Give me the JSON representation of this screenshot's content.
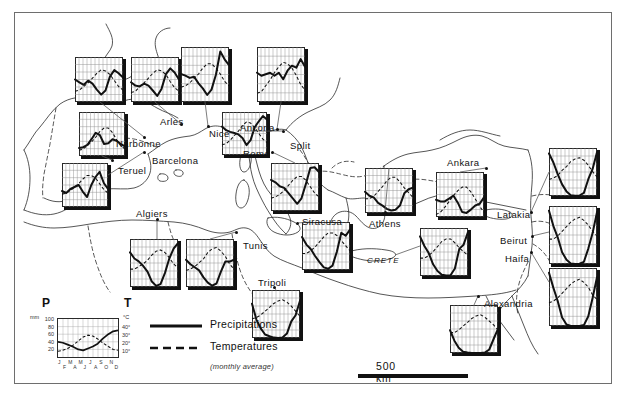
{
  "figure": {
    "frame_color": "#6e6e6e"
  },
  "legend": {
    "p_label": "P",
    "t_label": "T",
    "p_unit": "mm",
    "t_unit": "°C",
    "p_ticks": [
      "100",
      "80",
      "60",
      "40",
      "20"
    ],
    "t_ticks": [
      "40°",
      "30°",
      "20°",
      "10°"
    ],
    "months_top": [
      "J",
      "M",
      "M",
      "J",
      "S",
      "N"
    ],
    "months_bottom": [
      "F",
      "A",
      "J",
      "A",
      "O",
      "D"
    ],
    "key_precip": "Precipitations",
    "key_temp": "Temperatures",
    "note": "(monthly average)"
  },
  "scale": {
    "label": "500 km",
    "bar_km": 500
  },
  "cities": [
    {
      "name": "Arles",
      "label_x": 160,
      "label_y": 116,
      "dot_x": 181,
      "dot_y": 124
    },
    {
      "name": "Narbonne",
      "label_x": 116,
      "label_y": 138,
      "dot_x": 144,
      "dot_y": 137
    },
    {
      "name": "Nice",
      "label_x": 209,
      "label_y": 128,
      "dot_x": 208,
      "dot_y": 126
    },
    {
      "name": "Ancona",
      "label_x": 240,
      "label_y": 122,
      "dot_x": 277,
      "dot_y": 129
    },
    {
      "name": "Split",
      "label_x": 290,
      "label_y": 140,
      "dot_x": 283,
      "dot_y": 131
    },
    {
      "name": "Barcelona",
      "label_x": 152,
      "label_y": 155,
      "dot_x": 144,
      "dot_y": 152
    },
    {
      "name": "Teruel",
      "label_x": 118,
      "label_y": 165,
      "dot_x": 112,
      "dot_y": 160
    },
    {
      "name": "Rome",
      "label_x": 243,
      "label_y": 148,
      "dot_x": 272,
      "dot_y": 152
    },
    {
      "name": "Ankara",
      "label_x": 447,
      "label_y": 157,
      "dot_x": 486,
      "dot_y": 168
    },
    {
      "name": "Algiers",
      "label_x": 136,
      "label_y": 208,
      "dot_x": 157,
      "dot_y": 219
    },
    {
      "name": "Tunis",
      "label_x": 243,
      "label_y": 240,
      "dot_x": 236,
      "dot_y": 232
    },
    {
      "name": "Siracusa",
      "label_x": 302,
      "label_y": 216,
      "dot_x": 297,
      "dot_y": 223
    },
    {
      "name": "Athens",
      "label_x": 369,
      "label_y": 218,
      "dot_x": 385,
      "dot_y": 212
    },
    {
      "name": "Latakia",
      "label_x": 497,
      "label_y": 209,
      "dot_x": 531,
      "dot_y": 212
    },
    {
      "name": "Beirut",
      "label_x": 500,
      "label_y": 235,
      "dot_x": 532,
      "dot_y": 236
    },
    {
      "name": "Haifa",
      "label_x": 505,
      "label_y": 253,
      "dot_x": 531,
      "dot_y": 252
    },
    {
      "name": "Tripoli",
      "label_x": 258,
      "label_y": 277,
      "dot_x": 274,
      "dot_y": 287
    },
    {
      "name": "Alexandria",
      "label_x": 484,
      "label_y": 298,
      "dot_x": 478,
      "dot_y": 296
    }
  ],
  "regions": [
    {
      "name": "CRETE",
      "x": 367,
      "y": 256
    }
  ],
  "chart_data": {
    "type": "line",
    "xlabel": "",
    "ylabel": "",
    "grid": true,
    "legend_position": "bottom-left",
    "x": [
      "J",
      "F",
      "M",
      "A",
      "M",
      "J",
      "J",
      "A",
      "S",
      "O",
      "N",
      "D"
    ],
    "p_axis": {
      "unit": "mm",
      "ticks": [
        20,
        40,
        60,
        80,
        100
      ],
      "ylim": [
        0,
        100
      ]
    },
    "t_axis": {
      "unit": "°C",
      "ticks": [
        10,
        20,
        30,
        40
      ],
      "ylim": [
        0,
        40
      ]
    },
    "series_names": [
      "Precipitations",
      "Temperatures"
    ],
    "stations": [
      {
        "name": "Narbonne",
        "x": 75,
        "y": 57,
        "w": 48,
        "h": 45,
        "precipitation": [
          55,
          48,
          42,
          52,
          45,
          30,
          18,
          28,
          62,
          78,
          70,
          60
        ],
        "temperature": [
          7,
          8,
          11,
          14,
          18,
          22,
          25,
          24,
          21,
          16,
          11,
          8
        ]
      },
      {
        "name": "Arles",
        "x": 131,
        "y": 57,
        "w": 48,
        "h": 45,
        "precipitation": [
          48,
          40,
          38,
          45,
          40,
          28,
          15,
          32,
          68,
          82,
          72,
          55
        ],
        "temperature": [
          6,
          7,
          11,
          14,
          18,
          22,
          25,
          24,
          21,
          15,
          10,
          7
        ]
      },
      {
        "name": "Nice",
        "x": 181,
        "y": 47,
        "w": 48,
        "h": 55,
        "precipitation": [
          72,
          68,
          62,
          65,
          48,
          35,
          18,
          32,
          70,
          130,
          110,
          95
        ],
        "temperature": [
          8,
          9,
          11,
          14,
          17,
          21,
          24,
          24,
          21,
          17,
          12,
          9
        ]
      },
      {
        "name": "Ancona",
        "x": 257,
        "y": 47,
        "w": 48,
        "h": 55,
        "precipitation": [
          58,
          52,
          55,
          58,
          52,
          58,
          45,
          62,
          72,
          68,
          85,
          70
        ],
        "temperature": [
          4,
          5,
          9,
          13,
          18,
          22,
          25,
          24,
          21,
          16,
          10,
          6
        ]
      },
      {
        "name": "Teruel",
        "x": 79,
        "y": 112,
        "w": 46,
        "h": 44,
        "precipitation": [
          20,
          22,
          28,
          42,
          58,
          52,
          30,
          32,
          42,
          38,
          30,
          24
        ],
        "temperature": [
          3,
          4,
          7,
          10,
          14,
          19,
          22,
          22,
          18,
          12,
          7,
          4
        ]
      },
      {
        "name": "Barcelona",
        "x": 62,
        "y": 163,
        "w": 46,
        "h": 44,
        "precipitation": [
          40,
          35,
          45,
          50,
          55,
          38,
          25,
          55,
          75,
          88,
          60,
          45
        ],
        "temperature": [
          9,
          10,
          12,
          15,
          18,
          22,
          25,
          25,
          23,
          18,
          13,
          10
        ]
      },
      {
        "name": "Split",
        "x": 222,
        "y": 112,
        "w": 45,
        "h": 43,
        "precipitation": [
          80,
          70,
          65,
          62,
          58,
          48,
          28,
          42,
          78,
          95,
          110,
          100
        ],
        "temperature": [
          7,
          8,
          11,
          15,
          19,
          24,
          27,
          26,
          22,
          17,
          12,
          9
        ]
      },
      {
        "name": "Rome",
        "x": 271,
        "y": 163,
        "w": 48,
        "h": 48,
        "precipitation": [
          78,
          72,
          62,
          58,
          45,
          32,
          18,
          32,
          68,
          108,
          110,
          98
        ],
        "temperature": [
          8,
          9,
          11,
          14,
          18,
          22,
          25,
          25,
          22,
          17,
          12,
          9
        ]
      },
      {
        "name": "Athens",
        "x": 365,
        "y": 168,
        "w": 48,
        "h": 45,
        "precipitation": [
          52,
          42,
          38,
          25,
          18,
          10,
          6,
          8,
          18,
          48,
          58,
          62
        ],
        "temperature": [
          10,
          10,
          12,
          16,
          20,
          25,
          28,
          28,
          24,
          19,
          15,
          11
        ]
      },
      {
        "name": "Ankara",
        "x": 436,
        "y": 172,
        "w": 48,
        "h": 45,
        "precipitation": [
          42,
          38,
          38,
          45,
          52,
          35,
          12,
          10,
          18,
          28,
          32,
          48
        ],
        "temperature": [
          0,
          2,
          6,
          11,
          16,
          20,
          23,
          23,
          19,
          13,
          7,
          2
        ]
      },
      {
        "name": "Algiers",
        "x": 130,
        "y": 239,
        "w": 48,
        "h": 48,
        "precipitation": [
          95,
          78,
          70,
          58,
          42,
          15,
          3,
          8,
          38,
          78,
          105,
          120
        ],
        "temperature": [
          12,
          12,
          14,
          16,
          19,
          23,
          26,
          27,
          25,
          21,
          16,
          13
        ]
      },
      {
        "name": "Tunis",
        "x": 186,
        "y": 239,
        "w": 48,
        "h": 48,
        "precipitation": [
          62,
          52,
          45,
          38,
          22,
          10,
          3,
          8,
          35,
          58,
          58,
          62
        ],
        "temperature": [
          11,
          12,
          14,
          17,
          20,
          25,
          28,
          29,
          26,
          22,
          16,
          12
        ]
      },
      {
        "name": "Siracusa",
        "x": 302,
        "y": 222,
        "w": 48,
        "h": 48,
        "precipitation": [
          75,
          58,
          48,
          32,
          18,
          6,
          3,
          10,
          42,
          85,
          78,
          92
        ],
        "temperature": [
          11,
          11,
          13,
          16,
          20,
          24,
          27,
          27,
          25,
          21,
          17,
          13
        ]
      },
      {
        "name": "Crete",
        "x": 420,
        "y": 228,
        "w": 48,
        "h": 48,
        "precipitation": [
          95,
          72,
          55,
          28,
          12,
          3,
          1,
          2,
          18,
          65,
          75,
          105
        ],
        "temperature": [
          12,
          12,
          14,
          17,
          21,
          25,
          27,
          27,
          24,
          20,
          17,
          14
        ]
      },
      {
        "name": "Tripoli",
        "x": 252,
        "y": 290,
        "w": 48,
        "h": 48,
        "precipitation": [
          78,
          42,
          22,
          8,
          4,
          1,
          0,
          1,
          10,
          38,
          52,
          85
        ],
        "temperature": [
          13,
          14,
          16,
          19,
          22,
          25,
          27,
          28,
          26,
          23,
          19,
          15
        ]
      },
      {
        "name": "Latakia",
        "x": 549,
        "y": 148,
        "w": 48,
        "h": 48,
        "precipitation": [
          165,
          130,
          85,
          45,
          18,
          3,
          1,
          2,
          12,
          65,
          105,
          170
        ],
        "temperature": [
          11,
          12,
          14,
          18,
          21,
          25,
          27,
          28,
          26,
          22,
          17,
          13
        ]
      },
      {
        "name": "Beirut",
        "x": 549,
        "y": 206,
        "w": 48,
        "h": 58,
        "precipitation": [
          190,
          135,
          95,
          42,
          15,
          2,
          0,
          1,
          8,
          55,
          110,
          185
        ],
        "temperature": [
          14,
          14,
          16,
          19,
          22,
          25,
          27,
          28,
          26,
          23,
          19,
          16
        ]
      },
      {
        "name": "Haifa",
        "x": 549,
        "y": 268,
        "w": 48,
        "h": 58,
        "precipitation": [
          175,
          125,
          82,
          28,
          5,
          0,
          0,
          0,
          3,
          32,
          92,
          160
        ],
        "temperature": [
          13,
          14,
          16,
          19,
          22,
          25,
          27,
          28,
          26,
          23,
          18,
          15
        ]
      },
      {
        "name": "Alexandria",
        "x": 450,
        "y": 305,
        "w": 48,
        "h": 48,
        "precipitation": [
          52,
          28,
          12,
          3,
          1,
          0,
          0,
          0,
          1,
          8,
          32,
          55
        ],
        "temperature": [
          14,
          14,
          16,
          19,
          22,
          25,
          27,
          28,
          26,
          23,
          20,
          16
        ]
      }
    ]
  }
}
